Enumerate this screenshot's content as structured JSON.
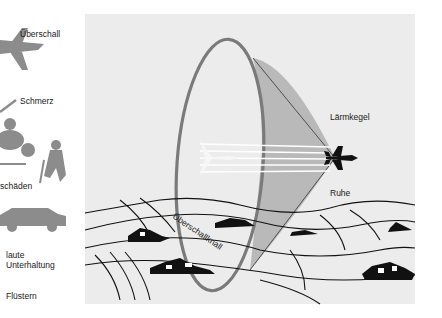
{
  "diagram": {
    "title": "Überschallknall",
    "noise_scale": [
      {
        "label": "Überschall",
        "icon": "jet-plane-icon"
      },
      {
        "label": "Schmerz",
        "icon": "pointer-line-icon"
      },
      {
        "label": "schäden",
        "icon": "jackhammer-worker-icon"
      },
      {
        "label": "laute\nUnterhaltung",
        "icon": "car-icon"
      },
      {
        "label": "Flüstern",
        "icon": ""
      }
    ],
    "labels": {
      "cone": "Lärmkegel",
      "quiet": "Ruhe",
      "boom": "Überschallknall",
      "scale_0": "Überschall",
      "scale_1": "Schmerz",
      "scale_2": "schäden",
      "scale_3a": "laute",
      "scale_3b": "Unterhaltung",
      "scale_4": "Flüstern"
    },
    "colors": {
      "panel": "#ececec",
      "cone": "#b9b9b9",
      "ring": "#7a7a7a",
      "icons": "#8c8c8c",
      "ink": "#111111"
    }
  }
}
